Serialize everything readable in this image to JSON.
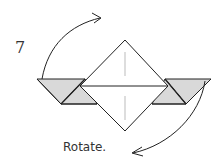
{
  "diagram": {
    "step_number": "7",
    "instruction": "Rotate.",
    "colors": {
      "line": "#222222",
      "fill_shaded": "#d9d9d9",
      "fill_paper": "#ffffff",
      "crease": "#bbbbbb"
    },
    "elements": [
      {
        "name": "center-square",
        "description": "Diamond (square on point) with horizontal midline and vertical crease lines"
      },
      {
        "name": "left-flap",
        "description": "Shaded parallelogram flap on left"
      },
      {
        "name": "right-flap",
        "description": "Shaded parallelogram flap on right"
      },
      {
        "name": "rotate-arrow-top",
        "description": "Curved arrow from left flap up to upper right"
      },
      {
        "name": "rotate-arrow-bottom",
        "description": "Curved arrow from right flap down to lower left"
      }
    ]
  }
}
